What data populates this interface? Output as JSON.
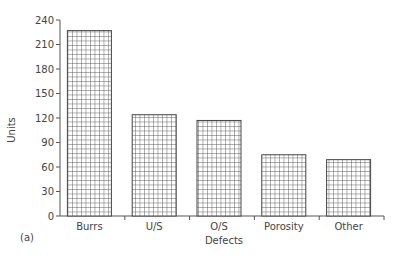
{
  "chart_data": {
    "type": "bar",
    "title": "",
    "panel_label": "(a)",
    "xlabel": "Defects",
    "ylabel": "Units",
    "categories": [
      "Burrs",
      "U/S",
      "O/S",
      "Porosity",
      "Other"
    ],
    "values": [
      227,
      124,
      117,
      75,
      69
    ],
    "ylim": [
      0,
      240
    ],
    "yticks": [
      0,
      30,
      60,
      90,
      120,
      150,
      180,
      210,
      240
    ],
    "grid": false,
    "legend": null,
    "bar_fill": "crosshatch grid pattern",
    "colors": {
      "bar_stroke": "#444444",
      "axis": "#555555",
      "background": "#ffffff"
    }
  }
}
